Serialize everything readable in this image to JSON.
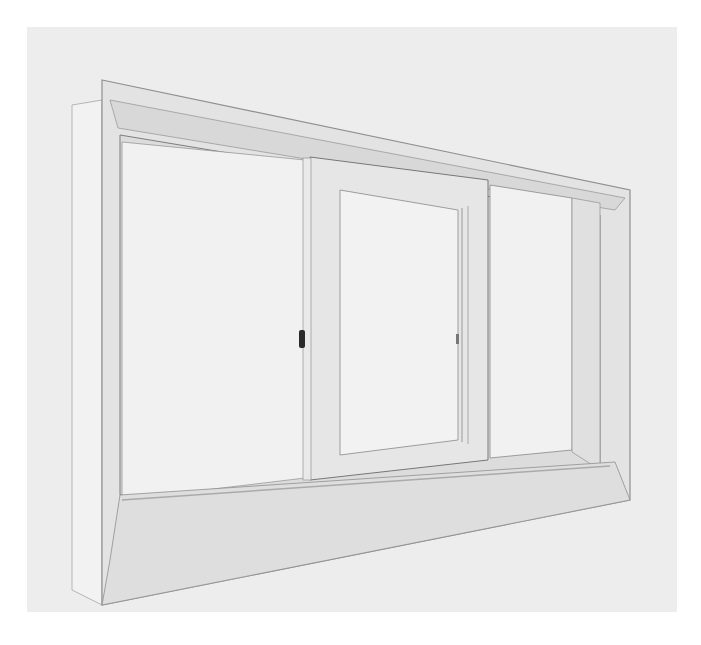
{
  "image": {
    "subject": "Sliding window unit with wooden frame mounted in a white wall",
    "style": "black-and-white photograph",
    "colors": {
      "page": "#ffffff",
      "wall": "#ededed",
      "frame": "#e4e4e4",
      "frame_shadow": "#c9c9c9",
      "frame_edge": "#8a8a8a",
      "glass": "#f0f0f0",
      "latch": "#2a2a2a"
    },
    "elements": [
      "outer-frame",
      "left-opening",
      "sliding-sash",
      "fixed-right-pane",
      "latch",
      "sill"
    ]
  }
}
